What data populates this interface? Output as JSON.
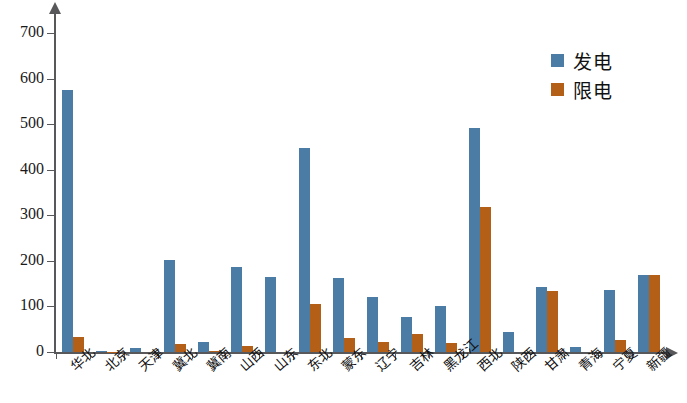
{
  "chart_data": {
    "type": "bar",
    "title": "",
    "xlabel": "",
    "ylabel": "",
    "ylim": [
      0,
      700
    ],
    "ytick_values": [
      0,
      100,
      200,
      300,
      400,
      500,
      600,
      700
    ],
    "ytick_labels": [
      "0",
      "100",
      "200",
      "300",
      "400",
      "500",
      "600",
      "700"
    ],
    "grid": false,
    "legend_position": "top-right",
    "categories": [
      "华北",
      "北京",
      "天津",
      "冀北",
      "冀南",
      "山西",
      "山东",
      "东北",
      "蒙东",
      "辽宁",
      "吉林",
      "黑龙江",
      "西北",
      "陕西",
      "甘肃",
      "青海",
      "宁夏",
      "新疆"
    ],
    "series": [
      {
        "name": "发电",
        "color": "#4a7ca6",
        "values": [
          576,
          3,
          8,
          201,
          22,
          187,
          165,
          448,
          162,
          120,
          76,
          100,
          492,
          45,
          143,
          12,
          135,
          168
        ]
      },
      {
        "name": "限电",
        "color": "#b35f18",
        "values": [
          32,
          1,
          0,
          17,
          2,
          13,
          0,
          105,
          31,
          22,
          40,
          20,
          318,
          0,
          133,
          0,
          26,
          168
        ]
      }
    ]
  },
  "legend": {
    "items": [
      {
        "label": "发电",
        "color": "#4a7ca6",
        "swatch": "blue-square-icon"
      },
      {
        "label": "限电",
        "color": "#b35f18",
        "swatch": "orange-square-icon"
      }
    ]
  },
  "axes": {
    "y_axis_name": "y-axis",
    "x_axis_name": "x-axis",
    "y_arrow_icon": "arrow-up-icon",
    "x_arrow_icon": "arrow-right-icon"
  }
}
